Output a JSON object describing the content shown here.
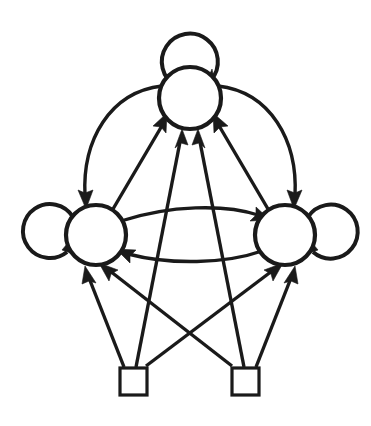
{
  "diagram": {
    "title": "State transition diagram",
    "type": "directed-graph",
    "background_color": "#ffffff",
    "stroke_color": "#1a1a1a",
    "canvas": {
      "width": 371,
      "height": 426
    },
    "nodes": [
      {
        "id": "top",
        "label": "",
        "shape": "circle",
        "cx": 190,
        "cy": 98,
        "r": 31,
        "name": "state-node-top"
      },
      {
        "id": "left",
        "label": "",
        "shape": "circle",
        "cx": 96,
        "cy": 235,
        "r": 30,
        "name": "state-node-left"
      },
      {
        "id": "right",
        "label": "",
        "shape": "circle",
        "cx": 285,
        "cy": 235,
        "r": 30,
        "name": "state-node-right"
      }
    ],
    "terminals": [
      {
        "id": "src-left",
        "label": "",
        "shape": "square",
        "x": 120,
        "y": 368,
        "size": 27,
        "name": "terminal-node-left"
      },
      {
        "id": "src-right",
        "label": "",
        "shape": "square",
        "x": 232,
        "y": 368,
        "size": 27,
        "name": "terminal-node-right"
      }
    ],
    "self_loops": [
      {
        "id": "loop-top",
        "node": "top",
        "cx": 190,
        "cy": 60,
        "r": 28,
        "name": "self-loop-top"
      },
      {
        "id": "loop-left",
        "node": "left",
        "cx": 55,
        "cy": 233,
        "r": 27,
        "name": "self-loop-left"
      },
      {
        "id": "loop-right",
        "node": "right",
        "cx": 325,
        "cy": 233,
        "r": 27,
        "name": "self-loop-right"
      }
    ],
    "edges": [
      {
        "id": "e1",
        "from": "top",
        "to": "left",
        "style": "curved-outer",
        "name": "edge-top-to-left"
      },
      {
        "id": "e2",
        "from": "top",
        "to": "right",
        "style": "curved-outer",
        "name": "edge-top-to-right"
      },
      {
        "id": "e3",
        "from": "left",
        "to": "top",
        "style": "straight",
        "name": "edge-left-to-top"
      },
      {
        "id": "e4",
        "from": "right",
        "to": "top",
        "style": "straight",
        "name": "edge-right-to-top"
      },
      {
        "id": "e5",
        "from": "left",
        "to": "right",
        "style": "curved-upper",
        "name": "edge-left-to-right"
      },
      {
        "id": "e6",
        "from": "right",
        "to": "left",
        "style": "curved-lower",
        "name": "edge-right-to-left"
      },
      {
        "id": "e7",
        "from": "src-left",
        "to": "left",
        "style": "straight",
        "name": "edge-srcleft-to-left"
      },
      {
        "id": "e8",
        "from": "src-left",
        "to": "top",
        "style": "straight",
        "name": "edge-srcleft-to-top"
      },
      {
        "id": "e9",
        "from": "src-left",
        "to": "right",
        "style": "straight",
        "name": "edge-srcleft-to-right"
      },
      {
        "id": "e10",
        "from": "src-right",
        "to": "right",
        "style": "straight",
        "name": "edge-srcright-to-right"
      },
      {
        "id": "e11",
        "from": "src-right",
        "to": "top",
        "style": "straight",
        "name": "edge-srcright-to-top"
      },
      {
        "id": "e12",
        "from": "src-right",
        "to": "left",
        "style": "straight",
        "name": "edge-srcright-to-left"
      }
    ],
    "counts": {
      "state_nodes": 3,
      "terminal_nodes": 2,
      "self_loops": 3,
      "directed_edges": 12
    }
  }
}
